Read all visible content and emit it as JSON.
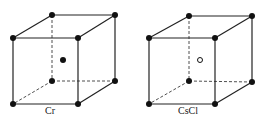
{
  "diagrams": [
    {
      "label": "Cr",
      "center_atom": "filled",
      "vertices": {
        "tbl": [
          52,
          15
        ],
        "tbr": [
          115,
          15
        ],
        "tfl": [
          13,
          38
        ],
        "tfr": [
          78,
          38
        ],
        "bbl": [
          52,
          81
        ],
        "bbr": [
          115,
          81
        ],
        "bfl": [
          13,
          104
        ],
        "bfr": [
          78,
          104
        ]
      },
      "center": [
        63,
        60
      ],
      "label_pos": [
        45,
        114
      ]
    },
    {
      "label": "CsCl",
      "center_atom": "open",
      "vertices": {
        "tbl": [
          189,
          16
        ],
        "tbr": [
          252,
          16
        ],
        "tfl": [
          149,
          38
        ],
        "tfr": [
          215,
          38
        ],
        "bbl": [
          189,
          81
        ],
        "bbr": [
          252,
          82
        ],
        "bfl": [
          149,
          104
        ],
        "bfr": [
          215,
          104
        ]
      },
      "center": [
        200,
        60
      ],
      "label_pos": [
        178,
        114
      ]
    }
  ],
  "colors": {
    "line": "#222222",
    "atom": "#111111"
  }
}
